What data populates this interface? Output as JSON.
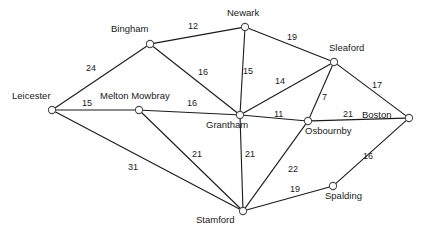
{
  "diagram": {
    "type": "weighted-undirected-graph",
    "title": "",
    "style": {
      "node_fill": "#ffffff",
      "node_stroke": "#4d4d4d",
      "edge_color": "#1a1a1a",
      "text_color": "#1a1a1a",
      "background": "#ffffff"
    },
    "nodes": [
      {
        "id": "leicester",
        "label": "Leicester",
        "x": 52,
        "y": 110,
        "label_x": 12,
        "label_y": 91
      },
      {
        "id": "bingham",
        "label": "Bingham",
        "x": 150,
        "y": 44,
        "label_x": 111,
        "label_y": 24
      },
      {
        "id": "melton_mowbray",
        "label": "Melton Mowbray",
        "x": 139,
        "y": 110,
        "label_x": 100,
        "label_y": 91
      },
      {
        "id": "newark",
        "label": "Newark",
        "x": 245,
        "y": 27,
        "label_x": 227,
        "label_y": 8
      },
      {
        "id": "sleaford",
        "label": "Sleaford",
        "x": 334,
        "y": 62,
        "label_x": 329,
        "label_y": 43
      },
      {
        "id": "grantham",
        "label": "Grantham",
        "x": 240,
        "y": 115,
        "label_x": 206,
        "label_y": 120
      },
      {
        "id": "osbournby",
        "label": "Osbournby",
        "x": 308,
        "y": 121,
        "label_x": 305,
        "label_y": 126
      },
      {
        "id": "boston",
        "label": "Boston",
        "x": 409,
        "y": 118,
        "label_x": 362,
        "label_y": 110
      },
      {
        "id": "stamford",
        "label": "Stamford",
        "x": 243,
        "y": 211,
        "label_x": 196,
        "label_y": 215
      },
      {
        "id": "spalding",
        "label": "Spalding",
        "x": 333,
        "y": 186,
        "label_x": 325,
        "label_y": 191
      }
    ],
    "edges": [
      {
        "from": "leicester",
        "to": "bingham",
        "weight": "24",
        "label_x": 86,
        "label_y": 64
      },
      {
        "from": "leicester",
        "to": "melton_mowbray",
        "weight": "15",
        "label_x": 82,
        "label_y": 99
      },
      {
        "from": "leicester",
        "to": "stamford",
        "weight": "31",
        "label_x": 128,
        "label_y": 163
      },
      {
        "from": "bingham",
        "to": "newark",
        "weight": "12",
        "label_x": 188,
        "label_y": 22
      },
      {
        "from": "bingham",
        "to": "grantham",
        "weight": "16",
        "label_x": 198,
        "label_y": 68
      },
      {
        "from": "melton_mowbray",
        "to": "grantham",
        "weight": "16",
        "label_x": 187,
        "label_y": 99
      },
      {
        "from": "melton_mowbray",
        "to": "stamford",
        "weight": "21",
        "label_x": 192,
        "label_y": 150
      },
      {
        "from": "newark",
        "to": "grantham",
        "weight": "15",
        "label_x": 243,
        "label_y": 67
      },
      {
        "from": "newark",
        "to": "sleaford",
        "weight": "19",
        "label_x": 287,
        "label_y": 33
      },
      {
        "from": "sleaford",
        "to": "grantham",
        "weight": "14",
        "label_x": 275,
        "label_y": 77
      },
      {
        "from": "sleaford",
        "to": "osbournby",
        "weight": "7",
        "label_x": 322,
        "label_y": 93
      },
      {
        "from": "sleaford",
        "to": "boston",
        "weight": "17",
        "label_x": 372,
        "label_y": 81
      },
      {
        "from": "grantham",
        "to": "osbournby",
        "weight": "11",
        "label_x": 274,
        "label_y": 110
      },
      {
        "from": "grantham",
        "to": "stamford",
        "weight": "21",
        "label_x": 245,
        "label_y": 150
      },
      {
        "from": "osbournby",
        "to": "boston",
        "weight": "21",
        "label_x": 343,
        "label_y": 110
      },
      {
        "from": "osbournby",
        "to": "stamford",
        "weight": "22",
        "label_x": 288,
        "label_y": 165
      },
      {
        "from": "boston",
        "to": "spalding",
        "weight": "16",
        "label_x": 363,
        "label_y": 152
      },
      {
        "from": "spalding",
        "to": "stamford",
        "weight": "19",
        "label_x": 290,
        "label_y": 185
      }
    ]
  }
}
